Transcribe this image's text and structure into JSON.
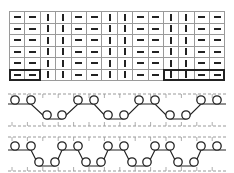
{
  "chart": {
    "columns": 14,
    "rows": 6,
    "row_pattern": [
      "purl",
      "purl",
      "knit",
      "knit",
      "purl",
      "purl",
      "knit",
      "knit",
      "purl",
      "purl",
      "knit",
      "knit",
      "purl",
      "purl"
    ],
    "symbols": {
      "purl": "−",
      "knit": "|"
    },
    "outlined_blocks": [
      {
        "row": 6,
        "col_start": 1,
        "col_end": 2
      },
      {
        "row": 6,
        "col_start": 11,
        "col_end": 14
      }
    ]
  },
  "stitch_diagrams": [
    {
      "name": "rib-2x2-loops",
      "top_loop_x": [
        15,
        31,
        78,
        94,
        139,
        155,
        201,
        217
      ],
      "bottom_loop_x": [
        47,
        62,
        108,
        124,
        170,
        186
      ]
    },
    {
      "name": "rib-2x2-loops-variant",
      "top_loop_x": [
        15,
        31,
        62,
        78,
        108,
        124,
        155,
        170,
        201,
        217
      ],
      "bottom_loop_x": [
        39,
        55,
        86,
        101,
        132,
        147,
        178,
        194
      ]
    }
  ],
  "colors": {
    "line": "#222222",
    "grid": "#9a9a9a",
    "dash": "#999999"
  }
}
